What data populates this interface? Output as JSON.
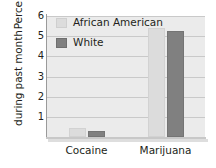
{
  "chart_data": {
    "type": "bar",
    "title": "",
    "xlabel": "",
    "ylabel": "Percentage using during past month",
    "ylabel_lines": [
      "Percentage using",
      "during past month"
    ],
    "categories": [
      "Cocaine",
      "Marijuana"
    ],
    "series": [
      {
        "name": "African American",
        "color": "#dcdcdc",
        "values": [
          0.45,
          5.4
        ]
      },
      {
        "name": "White",
        "color": "#808080",
        "values": [
          0.3,
          5.25
        ]
      }
    ],
    "ylim": [
      0,
      6
    ],
    "y_ticks": [
      1,
      2,
      3,
      4,
      5,
      6
    ],
    "y_tick_labels": [
      "1",
      "2",
      "3",
      "4",
      "5",
      "6"
    ],
    "grid": true,
    "grid_axis": "y",
    "legend_position": "upper-left-inside",
    "plot_background": "#ebebeb",
    "axis_color": "#9a9a9a",
    "gridline_color": "#c9c9c9",
    "text_color": "#231f20"
  },
  "legend": {
    "entries": [
      {
        "label": "African American"
      },
      {
        "label": "White"
      }
    ]
  }
}
